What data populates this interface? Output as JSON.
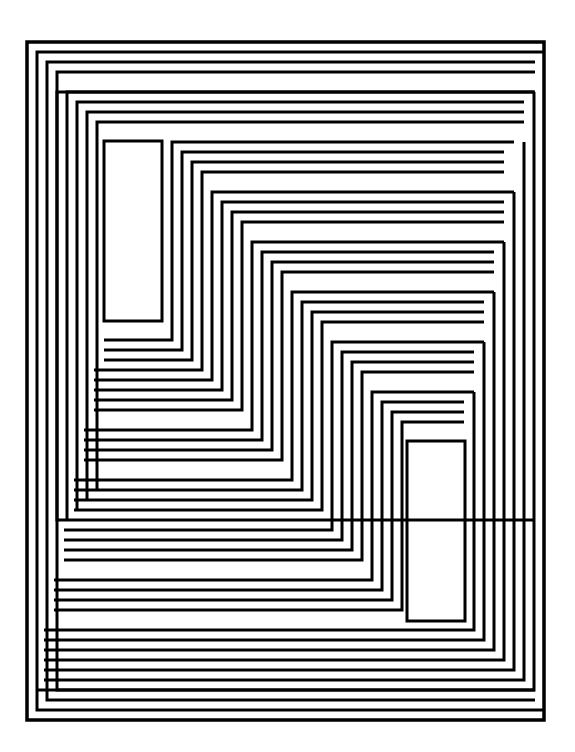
{
  "artwork": {
    "description": "Black-and-white op-art line composition of nested stepped rectangles",
    "colors": {
      "line": "#000000",
      "background": "#ffffff"
    },
    "frame": {
      "x": 26,
      "y": 41,
      "width": 519,
      "height": 680
    }
  }
}
